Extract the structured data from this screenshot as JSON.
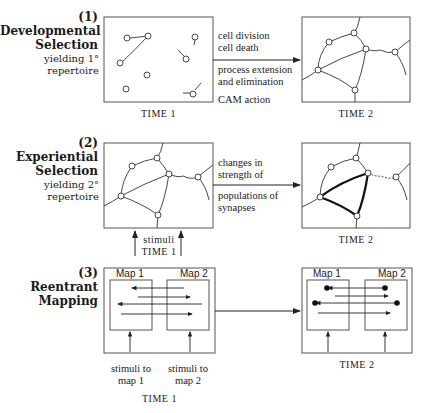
{
  "rows": [
    {
      "number": "(1)",
      "title_lines": [
        "Developmental",
        "Selection"
      ],
      "subtitle_lines": [
        "yielding 1°",
        "repertoire"
      ],
      "processes": [
        "cell division",
        "cell death",
        "process extension",
        "and elimination",
        "CAM action"
      ],
      "time1_label": "TIME 1",
      "time2_label": "TIME 2"
    },
    {
      "number": "(2)",
      "title_lines": [
        "Experiential",
        "Selection"
      ],
      "subtitle_lines": [
        "yielding 2°",
        "repertoire"
      ],
      "processes": [
        "changes in",
        "strength of",
        "populations of",
        "synapses"
      ],
      "stimuli_label": "stimuli",
      "time1_label": "TIME 1",
      "time2_label": "TIME 2"
    },
    {
      "number": "(3)",
      "title_lines": [
        "Reentrant",
        "Mapping"
      ],
      "map1_label": "Map 1",
      "map2_label": "Map 2",
      "stimuli_map1": [
        "stimuli to",
        "map 1"
      ],
      "stimuli_map2": [
        "stimuli to",
        "map 2"
      ],
      "time1_label": "TIME 1",
      "time2_label": "TIME 2"
    }
  ]
}
